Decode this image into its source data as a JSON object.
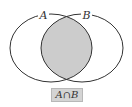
{
  "diagram": {
    "type": "venn",
    "sets": [
      {
        "label": "A"
      },
      {
        "label": "B"
      }
    ],
    "highlighted_region": "intersection",
    "caption": "A∩B",
    "colors": {
      "stroke": "#333333",
      "shade": "#cccccc",
      "caption_bg": "#d4d4d4"
    }
  }
}
